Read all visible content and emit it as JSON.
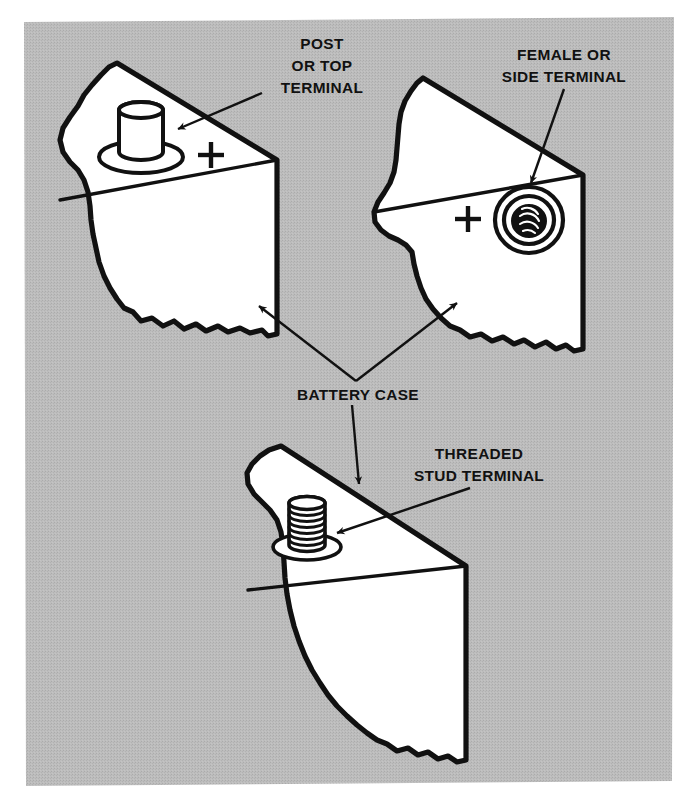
{
  "figure": {
    "name": "battery-terminal-types",
    "panel": {
      "background_color": "#b9b9b9",
      "page_color": "#ffffff",
      "ink_color": "#111111",
      "case_fill_color": "#ffffff"
    },
    "labels": {
      "post_terminal": {
        "line1": "POST",
        "line2": "OR TOP",
        "line3": "TERMINAL"
      },
      "side_terminal": {
        "line1": "FEMALE OR",
        "line2": "SIDE TERMINAL"
      },
      "battery_case": {
        "line1": "BATTERY CASE"
      },
      "stud_terminal": {
        "line1": "THREADED",
        "line2": "STUD TERMINAL"
      }
    },
    "polarity_marks": {
      "post_battery": "+",
      "side_battery": "+"
    },
    "parts": [
      {
        "id": "post-battery",
        "terminal_type": "post-or-top-terminal",
        "label": "POST OR TOP TERMINAL",
        "polarity": "+"
      },
      {
        "id": "side-battery",
        "terminal_type": "female-or-side-terminal",
        "label": "FEMALE OR SIDE TERMINAL",
        "polarity": "+"
      },
      {
        "id": "stud-battery",
        "terminal_type": "threaded-stud-terminal",
        "label": "THREADED STUD TERMINAL",
        "polarity": ""
      }
    ],
    "callouts": [
      {
        "id": "callout-post-terminal",
        "target": "post-terminal-cylinder"
      },
      {
        "id": "callout-side-terminal",
        "target": "side-terminal-socket"
      },
      {
        "id": "callout-battery-case-left",
        "target": "post-battery-case-edge"
      },
      {
        "id": "callout-battery-case-right",
        "target": "side-battery-case-edge"
      },
      {
        "id": "callout-battery-case-bottom",
        "target": "stud-battery-case-edge"
      },
      {
        "id": "callout-stud-terminal",
        "target": "stud-terminal-screw"
      }
    ]
  }
}
